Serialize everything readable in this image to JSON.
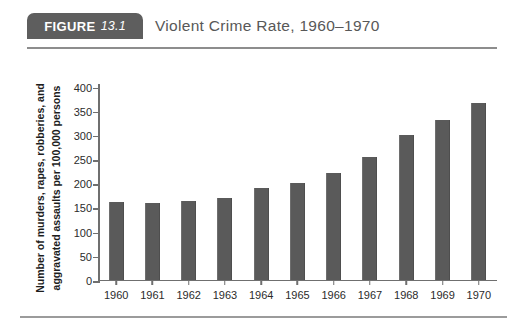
{
  "figure": {
    "badge_word": "FIGURE",
    "badge_number": "13.1",
    "title": "Violent Crime Rate, 1960–1970",
    "badge_color": "#5e5e5e",
    "bar_color": "#5a5a5a",
    "axis_color": "#6f6f6f"
  },
  "chart_data": {
    "type": "bar",
    "title": "Violent Crime Rate, 1960–1970",
    "xlabel": "",
    "ylabel": "Number of murders, rapes, robberies, and aggravated assaults per 100,000 persons",
    "ylabel_lines": [
      "Number of murders, rapes, robberies, and",
      "aggravated assaults per 100,000 persons"
    ],
    "categories": [
      "1960",
      "1961",
      "1962",
      "1963",
      "1964",
      "1965",
      "1966",
      "1967",
      "1968",
      "1969",
      "1970"
    ],
    "values": [
      160,
      158,
      162,
      168,
      190,
      200,
      220,
      253,
      298,
      329,
      364
    ],
    "ylim": [
      0,
      400
    ],
    "yticks": [
      400,
      350,
      300,
      250,
      200,
      150,
      100,
      50,
      0
    ],
    "ytick_labels": [
      "400",
      "350",
      "300",
      "250",
      "200",
      "150",
      "100",
      "50",
      "0"
    ],
    "grid": false,
    "legend": null
  }
}
